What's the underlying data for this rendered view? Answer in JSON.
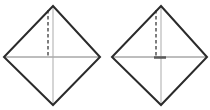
{
  "canvas": {
    "width": 210,
    "height": 110,
    "background": "#ffffff"
  },
  "colors": {
    "outline": "#2b2b2b",
    "crease_horizontal": "#7d7d7d",
    "crease_vertical": "#ababab",
    "fold_dashed": "#3a3a3a",
    "center_tick": "#5a5a5a"
  },
  "stroke_widths": {
    "outline": 2,
    "crease": 1,
    "fold_dashed": 1.3,
    "center_tick": 2.5
  },
  "diagrams": [
    {
      "name": "origami-step-left",
      "outline_points": "53,6 100,57 53,105 4,57",
      "creases": [
        {
          "x1": 4,
          "y1": 57,
          "x2": 100,
          "y2": 57,
          "role": "horizontal-crease"
        },
        {
          "x1": 53,
          "y1": 6,
          "x2": 53,
          "y2": 105,
          "role": "vertical-crease"
        }
      ],
      "fold_lines": [
        {
          "x1": 48,
          "y1": 10,
          "x2": 48,
          "y2": 57,
          "dash": "3.5 2.5",
          "role": "valley-fold-dashed"
        }
      ],
      "ticks": []
    },
    {
      "name": "origami-step-right",
      "outline_points": "161,6 207,57 161,105 112,57",
      "creases": [
        {
          "x1": 112,
          "y1": 57,
          "x2": 207,
          "y2": 57,
          "role": "horizontal-crease"
        },
        {
          "x1": 161,
          "y1": 6,
          "x2": 161,
          "y2": 105,
          "role": "vertical-crease"
        }
      ],
      "fold_lines": [
        {
          "x1": 156,
          "y1": 10,
          "x2": 156,
          "y2": 57,
          "dash": "3.5 2.5",
          "role": "valley-fold-dashed"
        }
      ],
      "ticks": [
        {
          "x1": 154,
          "y1": 57.5,
          "x2": 166,
          "y2": 57.5,
          "role": "center-mark"
        }
      ]
    }
  ]
}
